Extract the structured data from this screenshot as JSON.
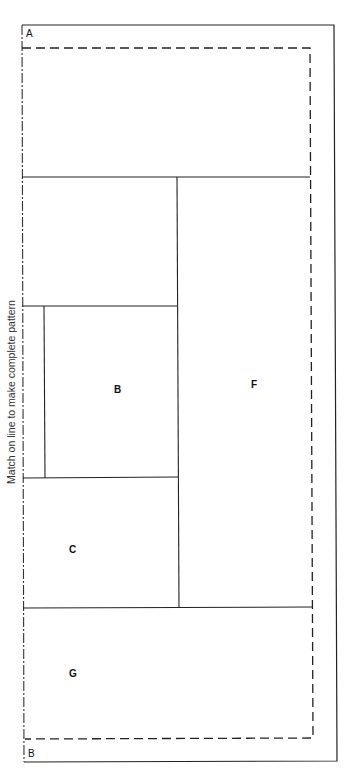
{
  "diagram": {
    "side_note": "Match on line to make complete pattern",
    "corner_labels": {
      "top": "A",
      "bottom": "B"
    },
    "pieces": [
      {
        "id": "B",
        "label": "B"
      },
      {
        "id": "C",
        "label": "C"
      },
      {
        "id": "F",
        "label": "F"
      },
      {
        "id": "G",
        "label": "G"
      }
    ],
    "line_styles": {
      "outer": "solid",
      "seam": "dashed",
      "match_line": "dash-dot"
    },
    "colors": {
      "line": "#222222",
      "background": "#ffffff"
    }
  }
}
